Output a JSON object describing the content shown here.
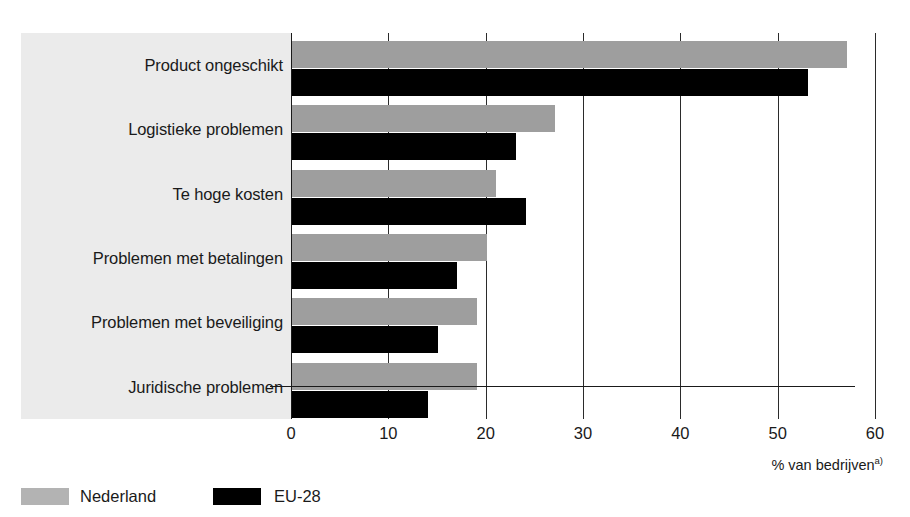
{
  "chart_data": {
    "type": "bar",
    "orientation": "horizontal",
    "title": "",
    "subtitle": "",
    "xlabel": "% van bedrijven",
    "xlabel_footnote_marker": "a)",
    "ylabel": "",
    "xlim": [
      0,
      60
    ],
    "xticks": [
      0,
      10,
      20,
      30,
      40,
      50,
      60
    ],
    "xtick_labels": [
      "0",
      "10",
      "20",
      "30",
      "40",
      "50",
      "60"
    ],
    "grid": true,
    "grid_axis": "x",
    "legend_position": "bottom-left",
    "categories": [
      "Product ongeschikt",
      "Logistieke problemen",
      "Te hoge kosten",
      "Problemen met betalingen",
      "Problemen met beveiliging",
      "Juridische problemen"
    ],
    "series": [
      {
        "name": "Nederland",
        "color": "#9e9e9e",
        "values": [
          57,
          27,
          21,
          20,
          19,
          19
        ]
      },
      {
        "name": "EU-28",
        "color": "#000000",
        "values": [
          53,
          23,
          24,
          17,
          15,
          14
        ]
      }
    ]
  },
  "axis": {
    "unit_caption": "% van bedrijven",
    "unit_caption_footnote": "a)"
  },
  "legend": {
    "items": [
      {
        "label": "Nederland",
        "color": "#9e9e9e"
      },
      {
        "label": "EU-28",
        "color": "#000000"
      }
    ]
  },
  "colors": {
    "series_nederland": "#9e9e9e",
    "series_eu28": "#000000",
    "label_panel_background": "#ebebeb",
    "axis_line": "#1a1a1a",
    "page_background": "#ffffff",
    "text": "#1a1a1a"
  }
}
